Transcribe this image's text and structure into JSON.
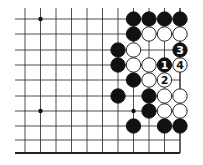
{
  "diagram": {
    "type": "go-board-fragment",
    "cols_x": [
      25,
      40.5,
      56,
      71.5,
      87,
      102.5,
      118,
      133.5,
      149,
      164.5,
      180
    ],
    "rows_y": [
      19,
      34,
      50,
      65,
      80,
      96,
      111,
      126,
      140,
      153
    ],
    "star_points": [
      [
        1,
        0
      ],
      [
        1,
        6
      ],
      [
        7,
        6
      ]
    ],
    "stones": [
      {
        "c": 7,
        "r": 0,
        "color": "black"
      },
      {
        "c": 8,
        "r": 0,
        "color": "black"
      },
      {
        "c": 9,
        "r": 0,
        "color": "black"
      },
      {
        "c": 10,
        "r": 0,
        "color": "black"
      },
      {
        "c": 7,
        "r": 1,
        "color": "black"
      },
      {
        "c": 8,
        "r": 1,
        "color": "white"
      },
      {
        "c": 9,
        "r": 1,
        "color": "white"
      },
      {
        "c": 10,
        "r": 1,
        "color": "white"
      },
      {
        "c": 6,
        "r": 2,
        "color": "black"
      },
      {
        "c": 7,
        "r": 2,
        "color": "white"
      },
      {
        "c": 10,
        "r": 2,
        "color": "black",
        "label": "3"
      },
      {
        "c": 6,
        "r": 3,
        "color": "black"
      },
      {
        "c": 7,
        "r": 3,
        "color": "white"
      },
      {
        "c": 8,
        "r": 3,
        "color": "white"
      },
      {
        "c": 9,
        "r": 3,
        "color": "black",
        "label": "1"
      },
      {
        "c": 10,
        "r": 3,
        "color": "white",
        "label": "4"
      },
      {
        "c": 7,
        "r": 4,
        "color": "black"
      },
      {
        "c": 8,
        "r": 4,
        "color": "white"
      },
      {
        "c": 9,
        "r": 4,
        "color": "white",
        "label": "2"
      },
      {
        "c": 6,
        "r": 5,
        "color": "black"
      },
      {
        "c": 8,
        "r": 5,
        "color": "black"
      },
      {
        "c": 9,
        "r": 5,
        "color": "white"
      },
      {
        "c": 10,
        "r": 5,
        "color": "white"
      },
      {
        "c": 8,
        "r": 6,
        "color": "black"
      },
      {
        "c": 9,
        "r": 6,
        "color": "white"
      },
      {
        "c": 10,
        "r": 6,
        "color": "white"
      },
      {
        "c": 7,
        "r": 7,
        "color": "black"
      },
      {
        "c": 9,
        "r": 7,
        "color": "black"
      },
      {
        "c": 10,
        "r": 7,
        "color": "black"
      }
    ],
    "move_labels": [
      "1",
      "2",
      "3",
      "4"
    ]
  }
}
